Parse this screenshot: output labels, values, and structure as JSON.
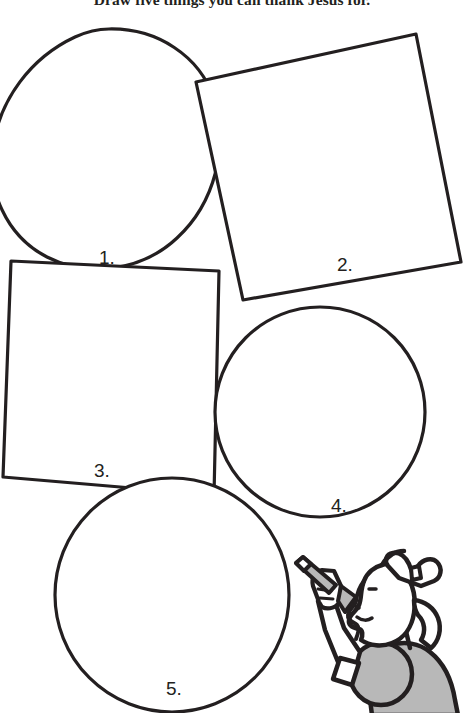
{
  "page": {
    "title": "Draw five things you can thank Jesus for.",
    "background_color": "#ffffff",
    "ink_color": "#231f20",
    "shade_color": "#b8b8b8",
    "width": 464,
    "height": 713
  },
  "shapes": [
    {
      "number": "1.",
      "kind": "circle",
      "label_x": 99,
      "label_y": 248
    },
    {
      "number": "2.",
      "kind": "square",
      "label_x": 337,
      "label_y": 255
    },
    {
      "number": "3.",
      "kind": "square",
      "label_x": 94,
      "label_y": 461
    },
    {
      "number": "4.",
      "kind": "circle",
      "label_x": 331,
      "label_y": 496
    },
    {
      "number": "5.",
      "kind": "circle",
      "label_x": 166,
      "label_y": 679
    }
  ],
  "illustration": {
    "name": "girl-drawing-with-crayon",
    "description": "A girl in profile wearing a hair bow, holding a crayon and drawing on the fifth circle.",
    "parts": [
      "hair-bow",
      "head-profile",
      "eye",
      "nose",
      "mouth",
      "arm",
      "hand",
      "crayon",
      "sleeve-cuff",
      "shoulder",
      "torso"
    ]
  }
}
